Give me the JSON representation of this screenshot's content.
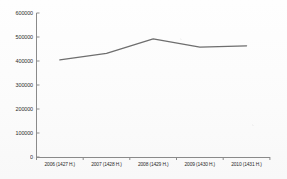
{
  "chart_data": {
    "type": "line",
    "title": "",
    "subtitle": "",
    "xlabel": "",
    "ylabel": "",
    "categories": [
      "2006 (1427 H.)",
      "2007 (1428 H.)",
      "2008 (1429 H.)",
      "2009 (1430 H.)",
      "2010 (1431 H.)"
    ],
    "values": [
      405000,
      432000,
      492000,
      458000,
      463000
    ],
    "series": [
      {
        "name": "",
        "values": [
          405000,
          432000,
          492000,
          458000,
          463000
        ]
      }
    ],
    "ylim": [
      0,
      600000
    ],
    "ytick_labels": [
      "0",
      "100000",
      "200000",
      "300000",
      "400000",
      "500000",
      "600000"
    ],
    "ytick_values": [
      0,
      100000,
      200000,
      300000,
      400000,
      500000,
      600000
    ],
    "grid": false,
    "legend": false,
    "legend_position": "none",
    "line_color": "#6e6e6e",
    "axis_color": "#8a8a8a",
    "text_color": "#2b2b2b"
  }
}
